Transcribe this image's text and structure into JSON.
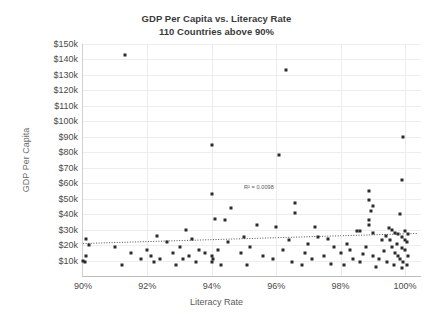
{
  "chart_data": {
    "type": "scatter",
    "title": "GDP Per Capita vs. Literacy Rate",
    "subtitle": "110 Countries above 90%",
    "xlabel": "Literacy Rate",
    "ylabel": "GDP Per Capita",
    "xlim": [
      90,
      100.5
    ],
    "ylim": [
      0,
      150
    ],
    "grid": true,
    "legend": null,
    "xticks": [
      "90%",
      "92%",
      "94%",
      "96%",
      "98%",
      "100%"
    ],
    "xtick_values": [
      90,
      92,
      94,
      96,
      98,
      100
    ],
    "yticks": [
      "$10k",
      "$20k",
      "$30k",
      "$40k",
      "$50k",
      "$60k",
      "$70k",
      "$80k",
      "$90k",
      "$100k",
      "$110k",
      "$120k",
      "$130k",
      "$140k",
      "$150k"
    ],
    "ytick_values": [
      10,
      20,
      30,
      40,
      50,
      60,
      70,
      80,
      90,
      100,
      110,
      120,
      130,
      140,
      150
    ],
    "annotations": [
      {
        "text": "R² = 0.0098",
        "x": 95.0,
        "y": 57
      }
    ],
    "trendline": {
      "type": "linear",
      "x_start": 90.0,
      "y_start": 21.0,
      "x_end": 100.4,
      "y_end": 27.5,
      "style": "dotted",
      "color": "#4d4d4d",
      "r_squared": 0.0098
    },
    "marker": {
      "shape": "square",
      "size": 3,
      "color": "#2b2b2b"
    },
    "points": [
      {
        "x": 91.3,
        "y": 143
      },
      {
        "x": 96.3,
        "y": 133
      },
      {
        "x": 99.95,
        "y": 90
      },
      {
        "x": 94.0,
        "y": 85
      },
      {
        "x": 96.1,
        "y": 78
      },
      {
        "x": 99.9,
        "y": 62
      },
      {
        "x": 98.9,
        "y": 55
      },
      {
        "x": 94.0,
        "y": 53
      },
      {
        "x": 98.9,
        "y": 49
      },
      {
        "x": 96.6,
        "y": 47
      },
      {
        "x": 99.0,
        "y": 45
      },
      {
        "x": 94.6,
        "y": 44
      },
      {
        "x": 98.95,
        "y": 42
      },
      {
        "x": 96.6,
        "y": 41
      },
      {
        "x": 99.85,
        "y": 40
      },
      {
        "x": 94.1,
        "y": 37
      },
      {
        "x": 94.4,
        "y": 36
      },
      {
        "x": 98.9,
        "y": 36
      },
      {
        "x": 95.4,
        "y": 33
      },
      {
        "x": 96.0,
        "y": 32
      },
      {
        "x": 97.2,
        "y": 32
      },
      {
        "x": 98.9,
        "y": 33
      },
      {
        "x": 99.5,
        "y": 31
      },
      {
        "x": 99.6,
        "y": 30
      },
      {
        "x": 93.2,
        "y": 30
      },
      {
        "x": 98.5,
        "y": 29
      },
      {
        "x": 98.6,
        "y": 29
      },
      {
        "x": 99.0,
        "y": 28
      },
      {
        "x": 99.7,
        "y": 28
      },
      {
        "x": 99.8,
        "y": 27
      },
      {
        "x": 100.0,
        "y": 29
      },
      {
        "x": 92.3,
        "y": 26
      },
      {
        "x": 95.0,
        "y": 25
      },
      {
        "x": 97.3,
        "y": 25
      },
      {
        "x": 99.4,
        "y": 26
      },
      {
        "x": 99.9,
        "y": 25
      },
      {
        "x": 100.1,
        "y": 27
      },
      {
        "x": 90.1,
        "y": 24
      },
      {
        "x": 93.4,
        "y": 24
      },
      {
        "x": 96.4,
        "y": 23
      },
      {
        "x": 97.6,
        "y": 24
      },
      {
        "x": 99.3,
        "y": 23
      },
      {
        "x": 99.55,
        "y": 23
      },
      {
        "x": 100.0,
        "y": 23
      },
      {
        "x": 92.6,
        "y": 22
      },
      {
        "x": 94.5,
        "y": 22
      },
      {
        "x": 97.0,
        "y": 21
      },
      {
        "x": 98.2,
        "y": 21
      },
      {
        "x": 99.75,
        "y": 21
      },
      {
        "x": 100.05,
        "y": 22
      },
      {
        "x": 90.2,
        "y": 20
      },
      {
        "x": 91.0,
        "y": 19
      },
      {
        "x": 93.0,
        "y": 19
      },
      {
        "x": 95.2,
        "y": 19
      },
      {
        "x": 97.8,
        "y": 19
      },
      {
        "x": 98.8,
        "y": 19
      },
      {
        "x": 99.6,
        "y": 19
      },
      {
        "x": 99.9,
        "y": 18
      },
      {
        "x": 92.0,
        "y": 17
      },
      {
        "x": 93.6,
        "y": 17
      },
      {
        "x": 94.2,
        "y": 17
      },
      {
        "x": 96.2,
        "y": 17
      },
      {
        "x": 98.3,
        "y": 17
      },
      {
        "x": 99.35,
        "y": 16
      },
      {
        "x": 100.0,
        "y": 17
      },
      {
        "x": 91.5,
        "y": 15
      },
      {
        "x": 92.8,
        "y": 15
      },
      {
        "x": 93.8,
        "y": 15
      },
      {
        "x": 94.9,
        "y": 15
      },
      {
        "x": 96.9,
        "y": 15
      },
      {
        "x": 98.0,
        "y": 15
      },
      {
        "x": 98.7,
        "y": 14
      },
      {
        "x": 99.7,
        "y": 15
      },
      {
        "x": 90.1,
        "y": 13
      },
      {
        "x": 92.1,
        "y": 13
      },
      {
        "x": 93.3,
        "y": 13
      },
      {
        "x": 94.0,
        "y": 13
      },
      {
        "x": 95.6,
        "y": 13
      },
      {
        "x": 97.5,
        "y": 13
      },
      {
        "x": 99.0,
        "y": 13
      },
      {
        "x": 99.8,
        "y": 13
      },
      {
        "x": 100.1,
        "y": 13
      },
      {
        "x": 91.8,
        "y": 11
      },
      {
        "x": 92.4,
        "y": 11
      },
      {
        "x": 93.1,
        "y": 11
      },
      {
        "x": 94.05,
        "y": 11
      },
      {
        "x": 95.9,
        "y": 11
      },
      {
        "x": 97.1,
        "y": 11
      },
      {
        "x": 98.4,
        "y": 11
      },
      {
        "x": 99.2,
        "y": 11
      },
      {
        "x": 99.85,
        "y": 11
      },
      {
        "x": 90.0,
        "y": 10
      },
      {
        "x": 90.05,
        "y": 9
      },
      {
        "x": 92.2,
        "y": 9
      },
      {
        "x": 93.5,
        "y": 9
      },
      {
        "x": 94.02,
        "y": 9
      },
      {
        "x": 96.5,
        "y": 9
      },
      {
        "x": 97.7,
        "y": 8
      },
      {
        "x": 98.6,
        "y": 9
      },
      {
        "x": 99.45,
        "y": 9
      },
      {
        "x": 99.95,
        "y": 9
      },
      {
        "x": 91.2,
        "y": 7
      },
      {
        "x": 92.9,
        "y": 7
      },
      {
        "x": 94.3,
        "y": 7
      },
      {
        "x": 95.1,
        "y": 7
      },
      {
        "x": 96.8,
        "y": 7
      },
      {
        "x": 98.1,
        "y": 7
      },
      {
        "x": 99.1,
        "y": 6
      },
      {
        "x": 99.65,
        "y": 7
      },
      {
        "x": 100.05,
        "y": 7
      },
      {
        "x": 99.9,
        "y": 5
      }
    ]
  }
}
